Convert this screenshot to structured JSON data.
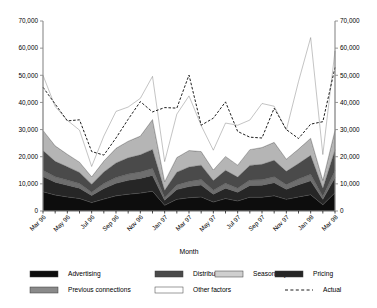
{
  "chart_data": {
    "type": "area",
    "stacked": true,
    "title": "",
    "xlabel": "Month",
    "ylabel": "",
    "ylabel_right": "",
    "ylim": [
      0,
      70000
    ],
    "yticks": [
      0,
      10000,
      20000,
      30000,
      40000,
      50000,
      60000,
      70000
    ],
    "ytick_labels": [
      "0",
      "10,000",
      "20,000",
      "30,000",
      "40,000",
      "50,000",
      "60,000",
      "70,000"
    ],
    "ylim_right": [
      0,
      70000
    ],
    "yticks_right": [
      0,
      10000,
      20000,
      30000,
      40000,
      50000,
      60000,
      70000
    ],
    "ytick_labels_right": [
      "0",
      "10,000",
      "20,000",
      "30,000",
      "40,000",
      "50,000",
      "60,000",
      "70,000"
    ],
    "grid": false,
    "legend_position": "bottom",
    "dual_axis": true,
    "x": [
      "Mar 96",
      "Apr 96",
      "May 96",
      "Jun 96",
      "Jul 96",
      "Aug 96",
      "Sep 96",
      "Oct 96",
      "Nov 96",
      "Dec 96",
      "Jan 97",
      "Feb 97",
      "Mar 97",
      "Apr 97",
      "May 97",
      "Jun 97",
      "Jul 97",
      "Aug 97",
      "Sep 97",
      "Oct 97",
      "Nov 97",
      "Dec 97",
      "Jan 98",
      "Feb 98",
      "Mar 98"
    ],
    "xtick_labels": [
      "Mar 96",
      "May 96",
      "Jul 96",
      "Sep 96",
      "Nov 96",
      "Jan 97",
      "Mar 97",
      "May 97",
      "Jul 97",
      "Sep 97",
      "Nov 97",
      "Jan 98",
      "Mar 98"
    ],
    "xtick_indices": [
      0,
      2,
      4,
      6,
      8,
      10,
      12,
      14,
      16,
      18,
      20,
      22,
      24
    ],
    "series": [
      {
        "name": "Advertising",
        "color": "#0d0d0d",
        "values": [
          7100,
          5900,
          5200,
          4600,
          3100,
          4400,
          5600,
          6200,
          6600,
          7300,
          2100,
          4300,
          4900,
          5200,
          3300,
          4600,
          3700,
          5100,
          5100,
          5600,
          4300,
          5200,
          6000,
          2300,
          6700
        ]
      },
      {
        "name": "Pricing",
        "color": "#262626",
        "values": [
          5600,
          4700,
          4300,
          3800,
          2600,
          3900,
          4600,
          5100,
          5400,
          5800,
          1900,
          3600,
          4100,
          4400,
          2900,
          3800,
          3200,
          4300,
          4400,
          4800,
          3700,
          4500,
          5100,
          2000,
          5600
        ]
      },
      {
        "name": "Previous connections",
        "color": "#6e6e6e",
        "values": [
          2300,
          2000,
          1900,
          1700,
          1200,
          1800,
          2100,
          2300,
          2400,
          2600,
          900,
          1700,
          1900,
          2000,
          1400,
          1800,
          1500,
          2000,
          2000,
          2200,
          1700,
          2100,
          2400,
          1000,
          2600
        ]
      },
      {
        "name": "Distribution",
        "color": "#4a4a4a",
        "values": [
          7300,
          5700,
          4900,
          4100,
          3000,
          4300,
          5400,
          6000,
          6300,
          7000,
          2700,
          4700,
          5300,
          5300,
          3600,
          4800,
          4100,
          5400,
          5700,
          6100,
          4900,
          5700,
          7000,
          3100,
          7700
        ]
      },
      {
        "name": "Seasonality",
        "color": "#b5b5b5",
        "values": [
          7400,
          5700,
          4600,
          3800,
          2700,
          4000,
          5400,
          6100,
          6900,
          11000,
          3200,
          5400,
          6100,
          5000,
          3900,
          5100,
          4400,
          5800,
          6200,
          6600,
          4500,
          5300,
          6300,
          2900,
          7200
        ]
      },
      {
        "name": "Other factors",
        "color": "#ffffff",
        "values": [
          20300,
          14500,
          12500,
          11800,
          3800,
          9200,
          13600,
          12600,
          13900,
          15900,
          7400,
          16000,
          20100,
          9600,
          7300,
          12300,
          14700,
          10900,
          16200,
          13300,
          10700,
          24900,
          37100,
          9500,
          29200
        ]
      }
    ],
    "overlay": {
      "name": "Actual",
      "style": "dashed",
      "color": "#111111",
      "values": [
        45600,
        39400,
        33200,
        33600,
        21900,
        20600,
        26900,
        33800,
        40300,
        36500,
        38100,
        37900,
        50100,
        31600,
        34200,
        40200,
        29300,
        27200,
        26900,
        37900,
        30000,
        26700,
        32000,
        32900,
        52900
      ]
    },
    "overlay_extra_note": ""
  },
  "legend": {
    "rows": [
      [
        {
          "label": "Advertising",
          "swatch": "#0d0d0d",
          "type": "box"
        },
        {
          "label": "Distribution",
          "swatch": "#4a4a4a",
          "type": "box"
        },
        {
          "label": "Seasonality",
          "swatch": "#cfcfcf",
          "type": "box"
        },
        {
          "label": "Pricing",
          "swatch": "#262626",
          "type": "box"
        }
      ],
      [
        {
          "label": "Previous connections",
          "swatch": "#8a8a8a",
          "type": "box"
        },
        {
          "label": "Other factors",
          "swatch": "#ffffff",
          "type": "box"
        },
        {
          "label": "Actual",
          "swatch": "#111111",
          "type": "dashed-line"
        }
      ]
    ]
  }
}
